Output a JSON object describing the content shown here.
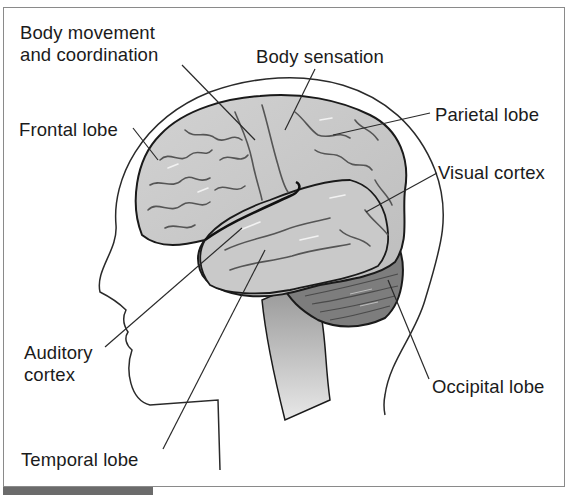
{
  "diagram": {
    "labels": {
      "body_movement": [
        "Body movement",
        "and coordination"
      ],
      "body_sensation": "Body sensation",
      "frontal_lobe": "Frontal lobe",
      "parietal_lobe": "Parietal lobe",
      "visual_cortex": "Visual cortex",
      "auditory_cortex": [
        "Auditory",
        "cortex"
      ],
      "occipital_lobe": "Occipital lobe",
      "temporal_lobe": "Temporal lobe"
    },
    "colors": {
      "cortex": "#c8c8c8",
      "cortex_dark": "#6e6e6e",
      "cerebellum": "#7a7a7a",
      "brainstem": "#a9a9a9",
      "outline": "#1a1a1a",
      "frame": "#8a8a8a"
    }
  }
}
